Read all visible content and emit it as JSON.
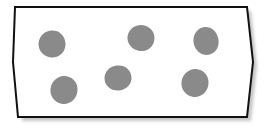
{
  "diagram": {
    "container": {
      "shape": "irregular-hexagon",
      "points": [
        [
          15,
          7
        ],
        [
          247,
          7
        ],
        [
          253,
          62
        ],
        [
          247,
          117
        ],
        [
          18,
          117
        ],
        [
          13,
          62
        ]
      ],
      "fill": "#ffffff",
      "stroke": "#111111",
      "stroke_width": 2,
      "shadow_color": "#c6c6c6",
      "shadow_offset": [
        4,
        4
      ]
    },
    "blobs": [
      {
        "id": "blob-1",
        "cx": 52,
        "cy": 44,
        "rx": 13.5,
        "ry": 13.5,
        "rot": -10
      },
      {
        "id": "blob-2",
        "cx": 141,
        "cy": 38,
        "rx": 13.5,
        "ry": 13,
        "rot": 15
      },
      {
        "id": "blob-3",
        "cx": 206,
        "cy": 41,
        "rx": 12.5,
        "ry": 14,
        "rot": -15
      },
      {
        "id": "blob-4",
        "cx": 64,
        "cy": 90,
        "rx": 13.5,
        "ry": 14,
        "rot": 10
      },
      {
        "id": "blob-5",
        "cx": 118,
        "cy": 78,
        "rx": 13.5,
        "ry": 12.5,
        "rot": -5
      },
      {
        "id": "blob-6",
        "cx": 195,
        "cy": 83,
        "rx": 13.5,
        "ry": 14,
        "rot": 10
      }
    ],
    "blob_color": "#8a8a8a"
  }
}
